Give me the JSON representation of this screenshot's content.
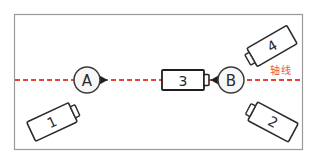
{
  "canvas": {
    "width": 319,
    "height": 163,
    "background": "#ffffff"
  },
  "frame": {
    "name": "diagram-frame",
    "x": 14,
    "y": 14,
    "width": 289,
    "height": 136,
    "stroke": "#9a9a9a"
  },
  "axis": {
    "label": "轴线",
    "label_color": "#e2584a",
    "line_color": "#e8403a",
    "y": 80,
    "x_start": 15,
    "x_end": 302,
    "dash_pattern": "5 3",
    "label_x": 270,
    "label_y": 70
  },
  "nodes": [
    {
      "id": "node-a",
      "label": "A",
      "cx": 87,
      "cy": 80,
      "r": 13,
      "marker_side": "right"
    },
    {
      "id": "node-b",
      "label": "B",
      "cx": 231,
      "cy": 80,
      "r": 13,
      "marker_side": "left"
    }
  ],
  "center_block": {
    "id": "center-unit-3",
    "label": "3",
    "x": 162,
    "y": 70,
    "width": 42,
    "height": 20,
    "tab_width": 5,
    "tab_height": 11
  },
  "units": [
    {
      "id": "unit-1",
      "label": "1",
      "cx": 52,
      "cy": 122,
      "width": 46,
      "height": 21,
      "rotation": -25,
      "tab_side": "right"
    },
    {
      "id": "unit-2",
      "label": "2",
      "cx": 273,
      "cy": 122,
      "width": 46,
      "height": 21,
      "rotation": 28,
      "tab_side": "left"
    },
    {
      "id": "unit-4",
      "label": "4",
      "cx": 272,
      "cy": 46,
      "width": 46,
      "height": 21,
      "rotation": -30,
      "tab_side": "left"
    }
  ]
}
